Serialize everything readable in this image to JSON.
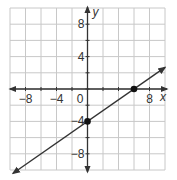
{
  "chart_data": {
    "type": "line",
    "title": "",
    "xlabel": "x",
    "ylabel": "y",
    "xlim": [
      -10,
      10
    ],
    "ylim": [
      -10,
      10
    ],
    "grid": true,
    "grid_step": 2,
    "x_ticks": [
      {
        "value": -8,
        "label": "−8"
      },
      {
        "value": -4,
        "label": "−4"
      },
      {
        "value": 8,
        "label": "8"
      }
    ],
    "y_ticks": [
      {
        "value": 8,
        "label": "8"
      },
      {
        "value": 4,
        "label": "4"
      },
      {
        "value": -4,
        "label": "−4"
      },
      {
        "value": -8,
        "label": "−8"
      }
    ],
    "origin_label": "0",
    "series": [
      {
        "name": "line",
        "equation": "y = (2/3)x - 4",
        "slope": 0.6667,
        "intercept": -4,
        "x_range": [
          -9.6,
          10
        ],
        "arrows_both_ends": true,
        "color": "#333333"
      }
    ],
    "points": [
      {
        "x": 0,
        "y": -4,
        "label": "y-intercept"
      },
      {
        "x": 6,
        "y": 0,
        "label": "x-intercept"
      }
    ]
  },
  "colors": {
    "grid": "#c8c8c8",
    "axis": "#333333",
    "line": "#333333",
    "point": "#111111"
  }
}
